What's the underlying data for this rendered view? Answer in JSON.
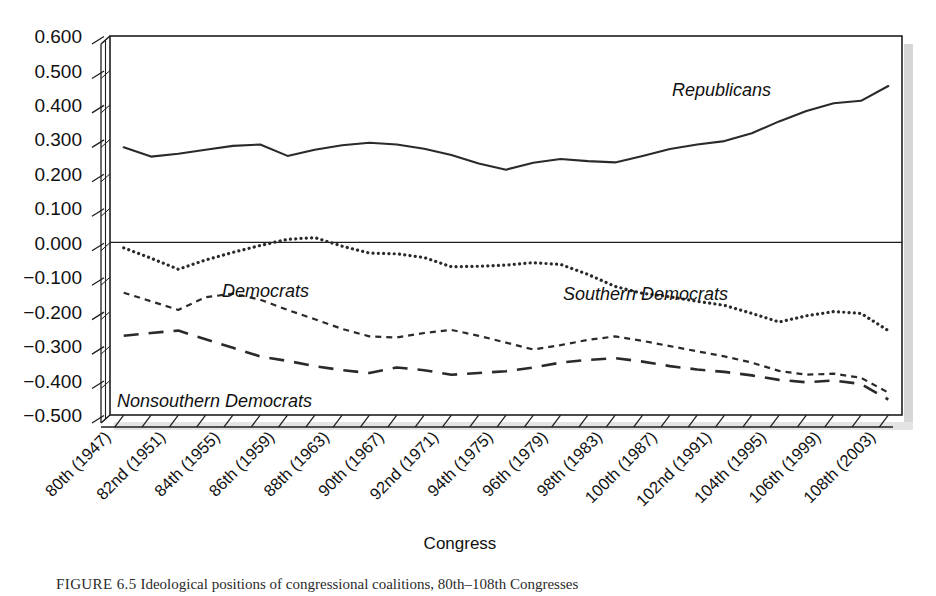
{
  "figure": {
    "caption_label": "FIGURE 6.5",
    "caption_text": "Ideological positions of congressional coalitions, 80th–108th Congresses"
  },
  "axes": {
    "x_title": "Congress",
    "y_tick_labels": [
      "0.600",
      "0.500",
      "0.400",
      "0.300",
      "0.200",
      "0.100",
      "0.000",
      "−0.100",
      "−0.200",
      "−0.300",
      "−0.400",
      "−0.500"
    ],
    "x_tick_labels": [
      "80th (1947)",
      "82nd (1951)",
      "84th (1955)",
      "86th (1959)",
      "88th (1963)",
      "90th (1967)",
      "92nd (1971)",
      "94th (1975)",
      "96th (1979)",
      "98th (1983)",
      "100th (1987)",
      "102nd (1991)",
      "104th (1995)",
      "106th (1999)",
      "108th (2003)"
    ]
  },
  "series_labels": {
    "republicans": "Republicans",
    "southern_democrats": "Southern Democrats",
    "democrats": "Democrats",
    "nonsouthern_democrats": "Nonsouthern Democrats"
  },
  "chart_data": {
    "type": "line",
    "title": "",
    "xlabel": "Congress",
    "ylabel": "",
    "ylim": [
      -0.5,
      0.6
    ],
    "grid": false,
    "legend_position": "inline-annotations",
    "x": [
      "80th (1947)",
      "81st (1949)",
      "82nd (1951)",
      "83rd (1953)",
      "84th (1955)",
      "85th (1957)",
      "86th (1959)",
      "87th (1961)",
      "88th (1963)",
      "89th (1965)",
      "90th (1967)",
      "91st (1969)",
      "92nd (1971)",
      "93rd (1973)",
      "94th (1975)",
      "95th (1977)",
      "96th (1979)",
      "97th (1981)",
      "98th (1983)",
      "99th (1985)",
      "100th (1987)",
      "101st (1989)",
      "102nd (1991)",
      "103rd (1993)",
      "104th (1995)",
      "105th (1997)",
      "106th (1999)",
      "107th (2001)",
      "108th (2003)"
    ],
    "series": [
      {
        "name": "Republicans",
        "style": "solid",
        "values": [
          0.277,
          0.25,
          0.258,
          0.27,
          0.281,
          0.285,
          0.252,
          0.27,
          0.283,
          0.29,
          0.285,
          0.273,
          0.255,
          0.23,
          0.212,
          0.232,
          0.243,
          0.237,
          0.233,
          0.252,
          0.272,
          0.285,
          0.295,
          0.318,
          0.352,
          0.382,
          0.405,
          0.412,
          0.455
        ]
      },
      {
        "name": "Southern Democrats",
        "style": "dotted",
        "values": [
          -0.015,
          -0.045,
          -0.077,
          -0.05,
          -0.028,
          -0.008,
          0.01,
          0.015,
          -0.01,
          -0.03,
          -0.032,
          -0.043,
          -0.07,
          -0.068,
          -0.065,
          -0.058,
          -0.063,
          -0.092,
          -0.127,
          -0.147,
          -0.157,
          -0.17,
          -0.182,
          -0.205,
          -0.23,
          -0.212,
          -0.2,
          -0.205,
          -0.255
        ]
      },
      {
        "name": "Democrats",
        "style": "dashed-short",
        "values": [
          -0.145,
          -0.17,
          -0.195,
          -0.158,
          -0.148,
          -0.165,
          -0.195,
          -0.222,
          -0.25,
          -0.272,
          -0.275,
          -0.262,
          -0.253,
          -0.27,
          -0.29,
          -0.31,
          -0.297,
          -0.282,
          -0.272,
          -0.285,
          -0.3,
          -0.315,
          -0.33,
          -0.348,
          -0.372,
          -0.383,
          -0.38,
          -0.392,
          -0.435
        ]
      },
      {
        "name": "Nonsouthern Democrats",
        "style": "dashed-long",
        "values": [
          -0.27,
          -0.262,
          -0.255,
          -0.28,
          -0.305,
          -0.33,
          -0.343,
          -0.358,
          -0.37,
          -0.378,
          -0.362,
          -0.37,
          -0.383,
          -0.378,
          -0.373,
          -0.362,
          -0.348,
          -0.34,
          -0.335,
          -0.345,
          -0.358,
          -0.368,
          -0.375,
          -0.385,
          -0.398,
          -0.405,
          -0.4,
          -0.41,
          -0.455
        ]
      }
    ]
  },
  "colors": {
    "line": "#2a2a2a",
    "axis": "#1f1f1f",
    "text": "#111111",
    "background": "#ffffff"
  }
}
